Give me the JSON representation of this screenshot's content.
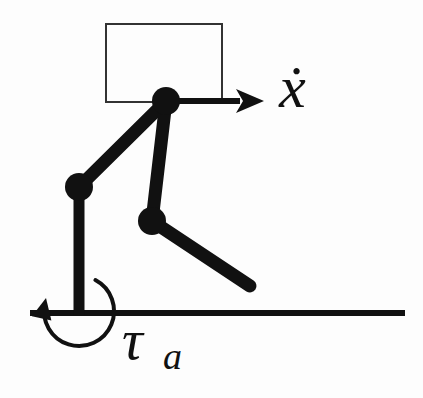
{
  "figure": {
    "background_color": "#fdfdfd",
    "ink_color": "#111111",
    "width": 423,
    "height": 398
  },
  "labels": {
    "velocity": {
      "name": "x-dot",
      "text": "x",
      "accent": "dot",
      "rendered": "ẋ",
      "meaning": "horizontal body velocity"
    },
    "torque": {
      "name": "tau-a",
      "text": "τ",
      "subscript": "a",
      "rendered": "τa",
      "meaning": "ankle actuator torque"
    }
  },
  "elements": {
    "body_rect": {
      "name": "body-rectangle",
      "x": 106,
      "y": 24,
      "width": 116,
      "height": 78,
      "stroke": "#333333",
      "stroke_width": 2,
      "fill": "none"
    },
    "ground_line": {
      "name": "ground-line",
      "x1": 30,
      "y1": 313,
      "x2": 405,
      "y2": 313,
      "stroke": "#111111",
      "stroke_width": 6
    },
    "velocity_arrow": {
      "name": "velocity-arrow",
      "x1": 168,
      "y1": 101,
      "x2": 258,
      "y2": 101,
      "stroke_width": 6,
      "head_length": 22,
      "head_half_width": 12
    },
    "torque_arc": {
      "name": "torque-arc",
      "center_x": 79,
      "center_y": 311,
      "radius": 35,
      "stroke_width": 4,
      "start_angle_deg": -62,
      "end_angle_deg": 192,
      "sweep": "counterclockwise",
      "arrowhead_at": "end",
      "arrowhead_x": 43,
      "arrowhead_y": 297
    }
  },
  "joints": [
    {
      "name": "hip-joint",
      "x": 166,
      "y": 101,
      "r": 14
    },
    {
      "name": "knee-joint-left",
      "x": 79,
      "y": 187,
      "r": 14
    },
    {
      "name": "knee-joint-mid",
      "x": 152,
      "y": 221,
      "r": 14
    }
  ],
  "links": [
    {
      "name": "link-hip-to-left-knee",
      "x1": 166,
      "y1": 101,
      "x2": 79,
      "y2": 187,
      "width": 13
    },
    {
      "name": "link-hip-to-mid-knee",
      "x1": 166,
      "y1": 101,
      "x2": 152,
      "y2": 221,
      "width": 13
    },
    {
      "name": "link-left-knee-to-foot",
      "x1": 79,
      "y1": 187,
      "x2": 79,
      "y2": 315,
      "width": 11
    },
    {
      "name": "link-mid-knee-to-toe",
      "x1": 152,
      "y1": 221,
      "x2": 250,
      "y2": 286,
      "width": 13
    }
  ]
}
